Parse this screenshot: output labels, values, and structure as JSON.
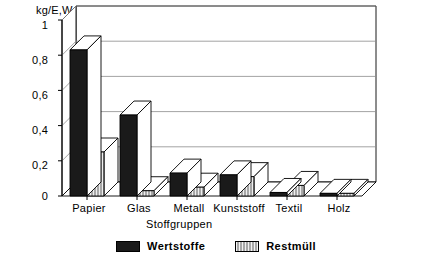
{
  "chart_data": {
    "type": "bar",
    "title": "",
    "subtitle": "",
    "xlabel": "Stoffgruppen",
    "ylabel": "kg/E,Wo",
    "ylim": [
      0,
      1
    ],
    "yticks": [
      "0",
      "0,2",
      "0,4",
      "0,6",
      "0,8",
      "1"
    ],
    "ytick_values": [
      0,
      0.2,
      0.4,
      0.6,
      0.8,
      1
    ],
    "grid": true,
    "legend_position": "bottom",
    "style": "3d-grouped-bar",
    "categories": [
      "Papier",
      "Glas",
      "Metall",
      "Kunststoff",
      "Textil",
      "Holz"
    ],
    "series": [
      {
        "name": "Wertstoffe",
        "color": "#1a1a1a",
        "fill": "solid-black",
        "values": [
          0.83,
          0.46,
          0.13,
          0.12,
          0.02,
          0.015
        ]
      },
      {
        "name": "Restmüll",
        "color": "#a8a8a8",
        "fill": "gray-hatched",
        "values": [
          0.25,
          0.03,
          0.05,
          0.11,
          0.06,
          0.015
        ]
      }
    ]
  },
  "legend": {
    "entries": [
      {
        "label": "Wertstoffe"
      },
      {
        "label": "Restmüll"
      }
    ]
  },
  "colors": {
    "series_wertstoffe": "#1a1a1a",
    "series_restmuell": "#a8a8a8",
    "axis": "#000000",
    "grid": "#808080",
    "background": "#ffffff"
  }
}
